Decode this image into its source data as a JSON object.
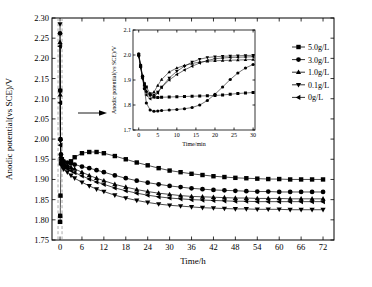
{
  "chart_data": {
    "type": "line",
    "title": "",
    "xlabel": "Time/h",
    "ylabel": "Anodic potential(vs SCE)/V",
    "xlim": [
      -2.2,
      75
    ],
    "ylim": [
      1.75,
      2.3
    ],
    "xticks": [
      0,
      6,
      12,
      18,
      24,
      30,
      36,
      42,
      48,
      54,
      60,
      66,
      72
    ],
    "yticks": [
      1.75,
      1.8,
      1.85,
      1.9,
      1.95,
      2.0,
      2.05,
      2.1,
      2.15,
      2.2,
      2.25,
      2.3
    ],
    "grid": false,
    "legend_position": "right",
    "annotations": {
      "arrow": "arrow-to-inset",
      "dashed_band": [
        -0.55,
        0.55
      ]
    },
    "series": [
      {
        "name": "5.0g/L",
        "marker": "square",
        "x": [
          0.0,
          0.02,
          0.05,
          0.08,
          0.12,
          0.17,
          0.25,
          0.33,
          0.5,
          1,
          2,
          3,
          4,
          6,
          8,
          10,
          12,
          15,
          18,
          21,
          24,
          27,
          30,
          33,
          36,
          39,
          42,
          45,
          48,
          51,
          54,
          57,
          60,
          63,
          66,
          69,
          72
        ],
        "y": [
          1.795,
          1.8,
          1.81,
          1.83,
          1.86,
          1.9,
          1.94,
          1.955,
          1.95,
          1.935,
          1.93,
          1.945,
          1.955,
          1.965,
          1.968,
          1.968,
          1.965,
          1.958,
          1.95,
          1.942,
          1.935,
          1.928,
          1.922,
          1.918,
          1.914,
          1.911,
          1.908,
          1.906,
          1.904,
          1.903,
          1.902,
          1.901,
          1.901,
          1.9,
          1.9,
          1.9,
          1.9
        ]
      },
      {
        "name": "3.0g/L",
        "marker": "circle",
        "x": [
          0.0,
          0.02,
          0.05,
          0.08,
          0.12,
          0.17,
          0.25,
          0.33,
          0.5,
          1,
          2,
          3,
          4,
          6,
          8,
          10,
          12,
          15,
          18,
          21,
          24,
          27,
          30,
          33,
          36,
          39,
          42,
          45,
          48,
          51,
          54,
          57,
          60,
          63,
          66,
          69,
          72
        ],
        "y": [
          2.262,
          2.2,
          2.12,
          2.05,
          2.0,
          1.975,
          1.962,
          1.955,
          1.95,
          1.945,
          1.942,
          1.94,
          1.937,
          1.932,
          1.928,
          1.923,
          1.918,
          1.91,
          1.903,
          1.897,
          1.892,
          1.888,
          1.884,
          1.881,
          1.878,
          1.876,
          1.874,
          1.873,
          1.872,
          1.871,
          1.87,
          1.87,
          1.869,
          1.869,
          1.869,
          1.869,
          1.869
        ]
      },
      {
        "name": "1.0g/L",
        "marker": "triangle-up",
        "x": [
          0.0,
          0.02,
          0.05,
          0.08,
          0.12,
          0.17,
          0.25,
          0.33,
          0.5,
          1,
          2,
          3,
          4,
          6,
          8,
          10,
          12,
          15,
          18,
          21,
          24,
          27,
          30,
          33,
          36,
          39,
          42,
          45,
          48,
          51,
          54,
          57,
          60,
          63,
          66,
          69,
          72
        ],
        "y": [
          2.24,
          2.19,
          2.11,
          2.05,
          2.0,
          1.972,
          1.958,
          1.95,
          1.945,
          1.94,
          1.935,
          1.93,
          1.926,
          1.918,
          1.91,
          1.903,
          1.897,
          1.888,
          1.881,
          1.875,
          1.87,
          1.866,
          1.863,
          1.86,
          1.858,
          1.857,
          1.856,
          1.855,
          1.854,
          1.854,
          1.853,
          1.853,
          1.853,
          1.852,
          1.852,
          1.852,
          1.852
        ]
      },
      {
        "name": "0.1g/L",
        "marker": "triangle-down",
        "x": [
          0.0,
          0.02,
          0.05,
          0.08,
          0.12,
          0.17,
          0.25,
          0.33,
          0.5,
          1,
          2,
          3,
          4,
          6,
          8,
          10,
          12,
          15,
          18,
          21,
          24,
          27,
          30,
          33,
          36,
          39,
          42,
          45,
          48,
          51,
          54,
          57,
          60,
          63,
          66,
          69,
          72
        ],
        "y": [
          2.285,
          2.21,
          2.12,
          2.05,
          1.995,
          1.963,
          1.948,
          1.94,
          1.933,
          1.925,
          1.918,
          1.91,
          1.903,
          1.893,
          1.884,
          1.876,
          1.87,
          1.861,
          1.854,
          1.848,
          1.843,
          1.839,
          1.836,
          1.834,
          1.832,
          1.83,
          1.829,
          1.828,
          1.827,
          1.827,
          1.826,
          1.826,
          1.826,
          1.825,
          1.825,
          1.825,
          1.825
        ]
      },
      {
        "name": "0g/L",
        "marker": "triangle-left",
        "x": [
          0.0,
          0.02,
          0.05,
          0.08,
          0.12,
          0.17,
          0.25,
          0.33,
          0.5,
          1,
          2,
          3,
          4,
          6,
          8,
          10,
          12,
          15,
          18,
          21,
          24,
          27,
          30,
          33,
          36,
          39,
          42,
          45,
          48,
          51,
          54,
          57,
          60,
          63,
          66,
          69,
          72
        ],
        "y": [
          2.23,
          2.17,
          2.09,
          2.03,
          1.985,
          1.96,
          1.948,
          1.942,
          1.938,
          1.932,
          1.927,
          1.922,
          1.917,
          1.909,
          1.901,
          1.894,
          1.888,
          1.879,
          1.872,
          1.866,
          1.861,
          1.857,
          1.854,
          1.852,
          1.85,
          1.849,
          1.848,
          1.847,
          1.846,
          1.846,
          1.845,
          1.845,
          1.845,
          1.845,
          1.845,
          1.845,
          1.845
        ]
      }
    ]
  },
  "inset_chart": {
    "type": "line",
    "xlabel": "Time/min",
    "ylabel": "Anodic potential(vs SCE)/V",
    "xlim": [
      -1.5,
      30.5
    ],
    "ylim": [
      1.7,
      2.1
    ],
    "xticks": [
      0,
      5,
      10,
      15,
      20,
      25,
      30
    ],
    "yticks": [
      1.7,
      1.8,
      1.9,
      2.0,
      2.1
    ],
    "grid": false,
    "series": [
      {
        "name": "5.0g/L",
        "marker": "square",
        "x": [
          0,
          0.5,
          1,
          1.5,
          2,
          3,
          4,
          5,
          6,
          8,
          10,
          12,
          14,
          16,
          18,
          20,
          22,
          24,
          26,
          28,
          30
        ],
        "y": [
          2.0,
          1.955,
          1.915,
          1.885,
          1.872,
          1.845,
          1.832,
          1.83,
          1.831,
          1.832,
          1.833,
          1.834,
          1.835,
          1.836,
          1.837,
          1.838,
          1.84,
          1.843,
          1.846,
          1.848,
          1.85
        ]
      },
      {
        "name": "3.0g/L",
        "marker": "circle",
        "x": [
          0,
          0.5,
          1,
          1.5,
          2,
          3,
          4,
          5,
          6,
          8,
          10,
          12,
          14,
          16,
          18,
          20,
          22,
          24,
          26,
          28,
          30
        ],
        "y": [
          2.005,
          1.96,
          1.915,
          1.865,
          1.808,
          1.78,
          1.775,
          1.776,
          1.778,
          1.78,
          1.782,
          1.785,
          1.79,
          1.8,
          1.818,
          1.843,
          1.872,
          1.902,
          1.928,
          1.948,
          1.962
        ]
      },
      {
        "name": "1.0g/L",
        "marker": "triangle-up",
        "x": [
          0,
          0.5,
          1,
          1.5,
          2,
          3,
          4,
          5,
          6,
          8,
          10,
          12,
          14,
          16,
          18,
          20,
          22,
          24,
          26,
          28,
          30
        ],
        "y": [
          2.0,
          1.955,
          1.912,
          1.88,
          1.856,
          1.84,
          1.852,
          1.878,
          1.902,
          1.932,
          1.948,
          1.958,
          1.966,
          1.972,
          1.975,
          1.977,
          1.978,
          1.979,
          1.98,
          1.981,
          1.982
        ]
      },
      {
        "name": "0.1g/L",
        "marker": "triangle-down",
        "x": [
          0,
          0.5,
          1,
          1.5,
          2,
          3,
          4,
          5,
          6,
          8,
          10,
          12,
          14,
          16,
          18,
          20,
          22,
          24,
          26,
          28,
          30
        ],
        "y": [
          1.995,
          1.95,
          1.908,
          1.875,
          1.852,
          1.838,
          1.84,
          1.852,
          1.872,
          1.908,
          1.935,
          1.955,
          1.972,
          1.983,
          1.99,
          1.993,
          1.995,
          1.996,
          1.997,
          1.998,
          1.999
        ]
      },
      {
        "name": "0g/L",
        "marker": "triangle-left",
        "x": [
          0,
          0.5,
          1,
          1.5,
          2,
          3,
          4,
          5,
          6,
          8,
          10,
          12,
          14,
          16,
          18,
          20,
          22,
          24,
          26,
          28,
          30
        ],
        "y": [
          1.998,
          1.952,
          1.905,
          1.868,
          1.84,
          1.825,
          1.832,
          1.848,
          1.87,
          1.9,
          1.922,
          1.94,
          1.955,
          1.968,
          1.978,
          1.985,
          1.988,
          1.99,
          1.991,
          1.992,
          1.993
        ]
      }
    ]
  },
  "legend": {
    "items": [
      {
        "label": "5.0g/L",
        "marker": "square"
      },
      {
        "label": "3.0g/L",
        "marker": "circle"
      },
      {
        "label": "1.0g/L",
        "marker": "triangle-up"
      },
      {
        "label": "0.1g/L",
        "marker": "triangle-down"
      },
      {
        "label": "0g/L",
        "marker": "triangle-left"
      }
    ]
  },
  "colors": {
    "line": "#000000",
    "marker": "#000000",
    "dashed_guide": "#888888",
    "background": "#ffffff"
  }
}
